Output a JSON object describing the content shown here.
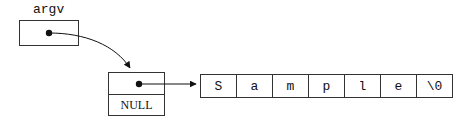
{
  "diagram": {
    "variable_label": "argv",
    "pointer_array": {
      "null_label": "NULL"
    },
    "string_cells": [
      "S",
      "a",
      "m",
      "p",
      "l",
      "e",
      "\\0"
    ],
    "stroke_color": "#333333",
    "background": "#ffffff"
  }
}
